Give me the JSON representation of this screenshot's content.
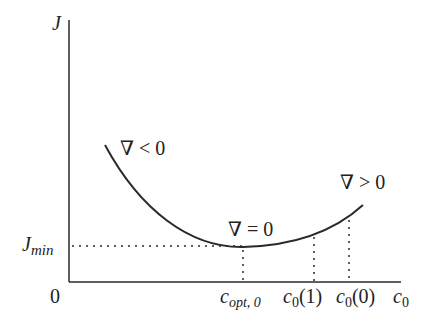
{
  "diagram": {
    "type": "cost-function-curve",
    "axes": {
      "y_label": "J",
      "x_label": "c",
      "x_label_sub": "0",
      "origin_label": "0"
    },
    "y_marks": {
      "jmin_main": "J",
      "jmin_sub": "min"
    },
    "x_marks": [
      {
        "main": "c",
        "sub": "opt, 0",
        "suffix": ""
      },
      {
        "main": "c",
        "sub": "0",
        "suffix": "(1)"
      },
      {
        "main": "c",
        "sub": "0",
        "suffix": "(0)"
      }
    ],
    "annotations": {
      "grad_neg": "∇ < 0",
      "grad_zero": "∇ = 0",
      "grad_pos": "∇ > 0"
    },
    "colors": {
      "line": "#2a2a2a",
      "text": "#222222"
    }
  }
}
